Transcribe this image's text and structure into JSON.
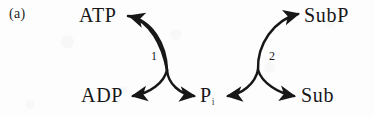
{
  "figure": {
    "panel_letter": "(a)",
    "ink_color": "#171717",
    "background_color": "#fdfdfd"
  },
  "nodes": [
    {
      "id": "atp",
      "label": "ATP",
      "position": "top-left"
    },
    {
      "id": "adp",
      "label": "ADP",
      "position": "bottom-left"
    },
    {
      "id": "pi",
      "label": "P",
      "subscript": "i",
      "position": "bottom-center"
    },
    {
      "id": "sub",
      "label": "Sub",
      "position": "bottom-right"
    },
    {
      "id": "subp",
      "label": "SubP",
      "position": "top-right"
    }
  ],
  "steps": [
    {
      "id": "step-1",
      "label": "1",
      "reaction": "ATP to ADP coupled with Pi release"
    },
    {
      "id": "step-2",
      "label": "2",
      "reaction": "Sub to SubP coupled with Pi uptake"
    }
  ],
  "arrows": [
    {
      "id": "arrow-atp-to-adp",
      "from": "ATP",
      "to": "ADP",
      "step": "1",
      "direction": "curved-left-down"
    },
    {
      "id": "arrow-pi-out",
      "from": "ATP",
      "to": "P",
      "step": "1",
      "direction": "curved-right-down"
    },
    {
      "id": "arrow-atp-in",
      "from": "ADP",
      "to": "ATP",
      "step": "1",
      "direction": "curved-up-left"
    },
    {
      "id": "arrow-sub-to-subp",
      "from": "Sub",
      "to": "SubP",
      "step": "2",
      "direction": "curved-right-up"
    },
    {
      "id": "arrow-pi-in",
      "from": "P",
      "to": "Sub",
      "step": "2",
      "direction": "curved-right-down"
    }
  ]
}
